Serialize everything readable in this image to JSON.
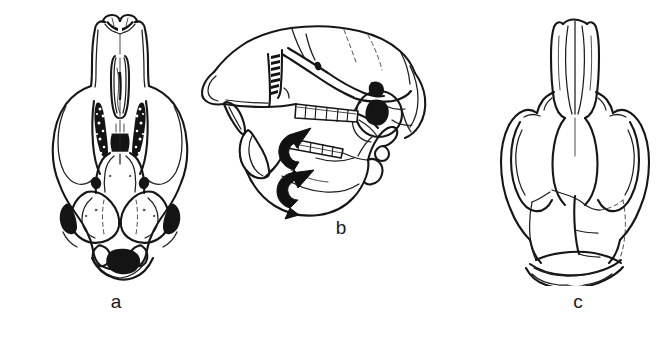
{
  "figure": {
    "background_color": "#ffffff",
    "ink_color": "#161616",
    "width_px": 671,
    "height_px": 337
  },
  "panels": [
    {
      "id": "a",
      "label": "a",
      "view": "ventral view of cranium",
      "description": "Ventral (palatal) view of a rodent skull showing incisors, incisive foramina, stippled upper molar rows, mesopterygoid fossa, auditory bullae and foramen magnum",
      "shaded_features": [
        "upper-molar-rows",
        "pterygoid-foramina",
        "bulla-openings",
        "foramen-magnum"
      ]
    },
    {
      "id": "b",
      "label": "b",
      "view": "lateral view of cranium with mandible",
      "description": "Left lateral view of the skull with mandible in place; two bold curved arrows indicate the upper and lower cheek-tooth (molar) rows",
      "shaded_features": [
        "external-auditory-meatus",
        "infraorbital-region-foramen",
        "temporal-foramen"
      ],
      "annotations": [
        {
          "name": "upper-molar-row-arrow",
          "points_to": "upper cheek-tooth row",
          "direction": "up-right"
        },
        {
          "name": "lower-molar-row-arrow",
          "points_to": "lower cheek-tooth row",
          "direction": "right"
        }
      ]
    },
    {
      "id": "c",
      "label": "c",
      "view": "dorsal view of cranium",
      "description": "Dorsal view of the skull showing paired nasals, zygomatic arches, frontals, parietals and interparietal bone with cranial sutures",
      "shaded_features": []
    }
  ],
  "labels": {
    "a": "a",
    "b": "b",
    "c": "c"
  }
}
